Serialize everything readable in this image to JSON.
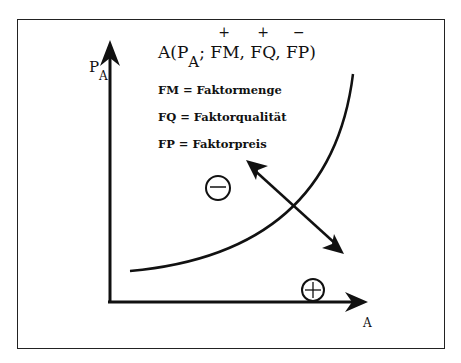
{
  "formula": {
    "prefix": "A(P",
    "subscript": "A",
    "sep": ";",
    "terms": [
      "FM,",
      "FQ,",
      "FP)"
    ],
    "signs": [
      "+",
      "+",
      "−"
    ]
  },
  "definitions": [
    "FM = Faktormenge",
    "FQ = Faktorqualität",
    "FP = Faktorpreis"
  ],
  "axes": {
    "y_label": "P",
    "y_subscript": "A",
    "x_label": "A"
  },
  "regions": {
    "minus_symbol": "−",
    "plus_symbol": "+"
  }
}
